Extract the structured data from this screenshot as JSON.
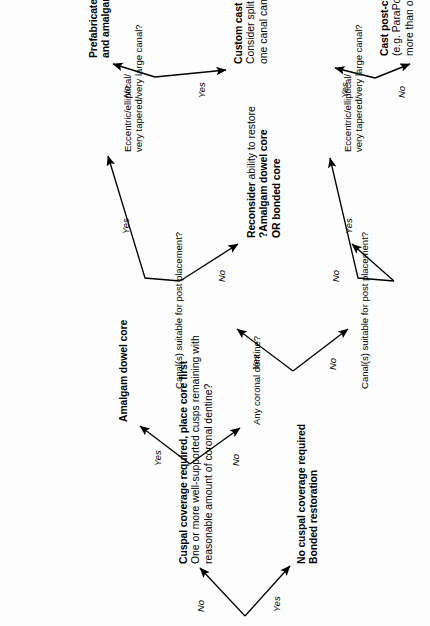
{
  "diagram": {
    "background": "#fdfdfd",
    "ink": "#000000",
    "orientation": "rotated-90-ccw",
    "nodes": {
      "q_cuspal": {
        "bold": "Cuspal coverage required, place core first",
        "line2": "One or more well-supported cusps remaining with",
        "line3": "reasonable amount of coronal dentine?"
      },
      "out_no_cuspal": {
        "line1": "No cuspal coverage required",
        "line2": "Bonded restoration"
      },
      "out_amalgam": {
        "line1": "Amalgam dowel core"
      },
      "q_any_coronal": {
        "line1": "Any coronal dentine?"
      },
      "q_canal_upper": {
        "line1": "Canal(s) suitable for post placement?"
      },
      "q_canal_lower": {
        "line1": "Canal(s) suitable for post placement?"
      },
      "out_reconsider": {
        "line1_bold": "Reconsider",
        "line1_reg": " ability to restore",
        "line2": "?Amalgam dowel core",
        "line3": "OR bonded core"
      },
      "q_ecc_upper": {
        "line1": "Eccentric/elliptical/",
        "line2": "very tapered/very large canal?"
      },
      "q_ecc_lower": {
        "line1": "Eccentric/elliptical/",
        "line2": "very tapered/very large canal?"
      },
      "out_prefab_post": {
        "line1_bold": "Prefabricated post",
        "line1_reg": " (in suitable canal)",
        "line2": "and amalgam dowel core"
      },
      "out_custom_cast": {
        "line1": "Custom cast post-core",
        "line2": "Consider split core if more than",
        "line3": "one canal can be utilised"
      },
      "out_cast_prefab": {
        "line1": "Cast post-core with prefabricated pattern",
        "line2": "(e.g. ParaPost) OR consider split core if",
        "line3": "more than one canal can be utilised"
      }
    },
    "edge_labels": {
      "root_yes": "Yes",
      "root_no": "No",
      "cuspal_yes": "Yes",
      "cuspal_no": "No",
      "coronal_yes": "Yes",
      "coronal_no": "No",
      "canal_upper_yes": "Yes",
      "canal_upper_no": "No",
      "canal_lower_yes": "Yes",
      "canal_lower_no": "No",
      "ecc_upper_yes": "Yes",
      "ecc_upper_no": "No",
      "ecc_lower_yes": "Yes",
      "ecc_lower_no": "No"
    }
  }
}
